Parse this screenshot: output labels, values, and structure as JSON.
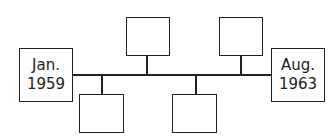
{
  "timeline": {
    "start": {
      "month": "Jan.",
      "year": "1959"
    },
    "end": {
      "month": "Aug.",
      "year": "1963"
    },
    "events_above": [
      {
        "label": ""
      },
      {
        "label": ""
      }
    ],
    "events_below": [
      {
        "label": ""
      },
      {
        "label": ""
      }
    ]
  }
}
